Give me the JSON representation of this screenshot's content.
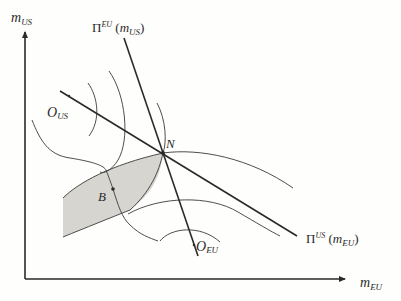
{
  "diagram": {
    "type": "game-theory-trade-diagram",
    "colors": {
      "background": "#fefefc",
      "ink": "#2a2a2a",
      "shaded_region": "#d6d5d0"
    },
    "axes": {
      "y": {
        "var": "m",
        "sub": "US"
      },
      "x": {
        "var": "m",
        "sub": "EU"
      }
    },
    "reaction_functions": {
      "eu": {
        "pi": "Π",
        "sup": "EU",
        "open": " (",
        "var": "m",
        "sub": "US",
        "close": ")"
      },
      "us": {
        "pi": "Π",
        "sup": "US",
        "open": " (",
        "var": "m",
        "sub": "EU",
        "close": ")"
      }
    },
    "points": {
      "nash": {
        "label": "N"
      },
      "bargain": {
        "label": "B"
      }
    },
    "origins": {
      "us": {
        "var": "O",
        "sub": "US"
      },
      "eu": {
        "var": "O",
        "sub": "EU"
      }
    }
  }
}
